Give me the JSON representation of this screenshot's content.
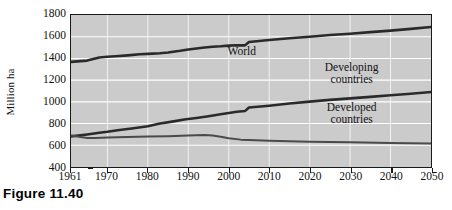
{
  "caption": "Figure 11.40",
  "chart_data": {
    "type": "line",
    "title": "",
    "xlabel": "",
    "ylabel": "Million ha",
    "xlim": [
      1961,
      2050
    ],
    "ylim": [
      400,
      1800
    ],
    "grid": "horizontal-white",
    "legend_position": "inline-annotations",
    "xticks": [
      1961,
      1970,
      1980,
      1990,
      2000,
      2010,
      2020,
      2030,
      2040,
      2050
    ],
    "xtick_labels": [
      "1961",
      "1970",
      "1980",
      "1990",
      "2000",
      "2010",
      "2020",
      "2030",
      "2040",
      "2050"
    ],
    "yticks": [
      400,
      600,
      800,
      1000,
      1200,
      1400,
      1600,
      1800
    ],
    "ytick_labels": [
      "400",
      "600",
      "800",
      "1000",
      "1200",
      "1400",
      "1600",
      "1800"
    ],
    "series": [
      {
        "name": "World",
        "label_lines": [
          "World"
        ],
        "color": "#2a2a2a",
        "width": 2.6,
        "x": [
          1961,
          1965,
          1968,
          1970,
          1972,
          1975,
          1978,
          1980,
          1983,
          1985,
          1988,
          1990,
          1992,
          1994,
          1996,
          1998,
          2000,
          2002,
          2004,
          2005,
          2010,
          2015,
          2020,
          2025,
          2030,
          2035,
          2040,
          2045,
          2050
        ],
        "y": [
          1368,
          1380,
          1408,
          1415,
          1420,
          1428,
          1438,
          1442,
          1448,
          1455,
          1470,
          1482,
          1492,
          1500,
          1508,
          1512,
          1518,
          1522,
          1520,
          1552,
          1570,
          1585,
          1600,
          1615,
          1628,
          1642,
          1656,
          1672,
          1690
        ]
      },
      {
        "name": "Developing countries",
        "label_lines": [
          "Developing",
          "countries"
        ],
        "color": "#2a2a2a",
        "width": 2.6,
        "x": [
          1961,
          1965,
          1968,
          1970,
          1973,
          1976,
          1980,
          1983,
          1986,
          1989,
          1992,
          1995,
          1998,
          2000,
          2002,
          2004,
          2005,
          2010,
          2015,
          2020,
          2025,
          2030,
          2035,
          2040,
          2045,
          2050
        ],
        "y": [
          682,
          700,
          715,
          724,
          740,
          755,
          775,
          800,
          818,
          838,
          852,
          868,
          886,
          898,
          908,
          915,
          948,
          965,
          985,
          1002,
          1018,
          1032,
          1046,
          1060,
          1075,
          1090
        ]
      },
      {
        "name": "Developed countries",
        "label_lines": [
          "Developed",
          "countries"
        ],
        "color": "#4a4a4a",
        "width": 2.0,
        "x": [
          1961,
          1963,
          1965,
          1967,
          1970,
          1975,
          1980,
          1985,
          1990,
          1992,
          1994,
          1996,
          1998,
          2000,
          2003,
          2005,
          2010,
          2015,
          2020,
          2030,
          2040,
          2050
        ],
        "y": [
          690,
          678,
          668,
          668,
          672,
          676,
          680,
          684,
          690,
          692,
          694,
          690,
          678,
          664,
          652,
          648,
          642,
          637,
          633,
          627,
          621,
          616
        ]
      }
    ],
    "annotations": [
      {
        "name": "world",
        "text": [
          "World"
        ],
        "x": 2003,
        "y": 1470
      },
      {
        "name": "developing",
        "text": [
          "Developing",
          "countries"
        ],
        "x": 2030,
        "y": 1270
      },
      {
        "name": "developed",
        "text": [
          "Developed",
          "countries"
        ],
        "x": 2030,
        "y": 905
      }
    ]
  }
}
